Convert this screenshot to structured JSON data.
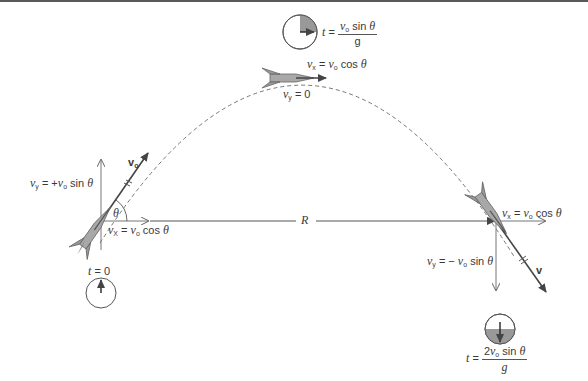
{
  "figure": {
    "type": "projectile-motion-diagram"
  },
  "labels": {
    "launch": {
      "vy_var": "v",
      "vy_sub": "y",
      "vy_eq": " = +",
      "vy_v0": "v",
      "vy_v0_sub": "o",
      "vy_trig": " sin ",
      "vy_theta": "θ",
      "vx_var": "v",
      "vx_sub": "X",
      "vx_eq": " = ",
      "vx_v0": "v",
      "vx_v0_sub": "o",
      "vx_trig": " cos ",
      "vx_theta": "θ",
      "velocity_var": "v",
      "velocity_sub": "o",
      "angle": "θ",
      "time_var": "t",
      "time_eq": " = 0"
    },
    "apex": {
      "time_var": "t",
      "time_eq": " = ",
      "time_num_v": "v",
      "time_num_sub": "o",
      "time_num_trig": " sin ",
      "time_num_theta": "θ",
      "time_den": "g",
      "vx_var": "v",
      "vx_sub": "x",
      "vx_eq": " = ",
      "vx_v0": "v",
      "vx_v0_sub": "o",
      "vx_trig": " cos ",
      "vx_theta": "θ",
      "vy_var": "v",
      "vy_sub": "y",
      "vy_eq": " = 0"
    },
    "range": {
      "label": "R"
    },
    "landing": {
      "vx_var": "v",
      "vx_sub": "x",
      "vx_eq": " = ",
      "vx_v0": "v",
      "vx_v0_sub": "o",
      "vx_trig": " cos ",
      "vx_theta": "θ",
      "vy_var": "v",
      "vy_sub": "y",
      "vy_eq": " = − ",
      "vy_v0": "v",
      "vy_v0_sub": "o",
      "vy_trig": " sin ",
      "vy_theta": "θ",
      "velocity_var": "v",
      "time_var": "t",
      "time_eq": " = ",
      "time_num_coef": "2",
      "time_num_v": "v",
      "time_num_sub": "o",
      "time_num_trig": " sin ",
      "time_num_theta": "θ",
      "time_den": "g"
    }
  },
  "colors": {
    "line": "#555555",
    "rocket_fill": "#a8a8a8",
    "rocket_dark": "#6e6e6e",
    "clock_fill": "#9a9a9a",
    "top_bar": "#5a5a5a"
  }
}
